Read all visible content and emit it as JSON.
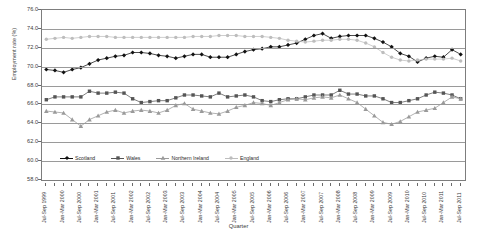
{
  "chart_data": {
    "type": "line",
    "title": "",
    "xlabel": "Quarter",
    "ylabel": "Employment rate (%)",
    "ylim": [
      58.0,
      76.0
    ],
    "ytick_labels": [
      "58.0",
      "60.0",
      "62.0",
      "64.0",
      "66.0",
      "68.0",
      "70.0",
      "72.0",
      "74.0",
      "76.0"
    ],
    "yticks": [
      58.0,
      60.0,
      62.0,
      64.0,
      66.0,
      68.0,
      70.0,
      72.0,
      74.0,
      76.0
    ],
    "grid": true,
    "legend_position": "inside-bottom",
    "categories": [
      "Jul-Sep 1999",
      "Oct-Dec 1999",
      "Jan-Mar 2000",
      "Apr-Jun 2000",
      "Jul-Sep 2000",
      "Oct-Dec 2000",
      "Jan-Mar 2001",
      "Apr-Jun 2001",
      "Jul-Sep 2001",
      "Oct-Dec 2001",
      "Jan-Mar 2002",
      "Apr-Jun 2002",
      "Jul-Sep 2002",
      "Oct-Dec 2002",
      "Jan-Mar 2003",
      "Apr-Jun 2003",
      "Jul-Sep 2003",
      "Oct-Dec 2003",
      "Jan-Mar 2004",
      "Apr-Jun 2004",
      "Jul-Sep 2004",
      "Oct-Dec 2004",
      "Jan-Mar 2005",
      "Apr-Jun 2005",
      "Jul-Sep 2005",
      "Oct-Dec 2005",
      "Jan-Mar 2006",
      "Apr-Jun 2006",
      "Jul-Sep 2006",
      "Oct-Dec 2006",
      "Jan-Mar 2007",
      "Apr-Jun 2007",
      "Jul-Sep 2007",
      "Oct-Dec 2007",
      "Jan-Mar 2008",
      "Apr-Jun 2008",
      "Jul-Sep 2008",
      "Oct-Dec 2008",
      "Jan-Mar 2009",
      "Apr-Jun 2009",
      "Jul-Sep 2009",
      "Oct-Dec 2009",
      "Jan-Mar 2010",
      "Apr-Jun 2010",
      "Jul-Sep 2010",
      "Oct-Dec 2010",
      "Jan-Mar 2011",
      "Apr-Jun 2011",
      "Jul-Sep 2011"
    ],
    "xtick_labels": [
      "Jul-Sep 1999",
      "",
      "Jan-Mar 2000",
      "",
      "Jul-Sep 2000",
      "",
      "Jan-Mar 2001",
      "",
      "Jul-Sep 2001",
      "",
      "Jan-Mar 2002",
      "",
      "Jul-Sep 2002",
      "",
      "Jan-Mar 2003",
      "",
      "Jul-Sep 2003",
      "",
      "Jan-Mar 2004",
      "",
      "Jul-Sep 2004",
      "",
      "Jan-Mar 2005",
      "",
      "Jul-Sep 2005",
      "",
      "Jan-Mar 2006",
      "",
      "Jul-Sep 2006",
      "",
      "Jan-Mar 2007",
      "",
      "Jul-Sep 2007",
      "",
      "Jan-Mar 2008",
      "",
      "Jul-Sep 2008",
      "",
      "Jan-Mar 2009",
      "",
      "Jul-Sep 2009",
      "",
      "Jan-Mar 2010",
      "",
      "Jul-Sep 2010",
      "",
      "Jan-Mar 2011",
      "",
      "Jul-Sep 2011"
    ],
    "series": [
      {
        "name": "Scotland",
        "color": "#111111",
        "marker": "diamond",
        "values": [
          69.7,
          69.6,
          69.4,
          69.7,
          69.9,
          70.3,
          70.7,
          70.9,
          71.1,
          71.2,
          71.5,
          71.5,
          71.4,
          71.2,
          71.1,
          70.9,
          71.1,
          71.3,
          71.3,
          71.0,
          71.0,
          71.0,
          71.3,
          71.6,
          71.8,
          71.9,
          72.1,
          72.1,
          72.3,
          72.5,
          72.9,
          73.3,
          73.5,
          73.0,
          73.2,
          73.3,
          73.3,
          73.3,
          73.0,
          72.6,
          72.1,
          71.4,
          71.1,
          70.5,
          70.9,
          71.1,
          71.0,
          71.8,
          71.3
        ]
      },
      {
        "name": "Wales",
        "color": "#555555",
        "marker": "square",
        "values": [
          66.5,
          66.8,
          66.8,
          66.8,
          66.8,
          67.4,
          67.2,
          67.2,
          67.3,
          67.2,
          66.6,
          66.2,
          66.3,
          66.4,
          66.4,
          66.7,
          67.0,
          67.0,
          66.9,
          66.8,
          67.2,
          66.8,
          66.9,
          67.0,
          66.8,
          66.4,
          66.3,
          66.5,
          66.6,
          66.6,
          66.8,
          67.0,
          67.0,
          67.0,
          67.5,
          67.1,
          67.1,
          66.9,
          66.9,
          66.6,
          66.2,
          66.2,
          66.4,
          66.6,
          67.0,
          67.3,
          67.2,
          67.0,
          66.6
        ]
      },
      {
        "name": "Northern Ireland",
        "color": "#9a9a9a",
        "marker": "triangle",
        "values": [
          65.3,
          65.2,
          65.1,
          64.4,
          63.7,
          64.4,
          64.8,
          65.2,
          65.4,
          65.1,
          65.3,
          65.4,
          65.3,
          65.1,
          65.4,
          65.9,
          66.1,
          65.5,
          65.3,
          65.1,
          65.0,
          65.3,
          65.7,
          65.9,
          66.2,
          66.1,
          65.9,
          66.2,
          66.5,
          66.6,
          66.5,
          66.7,
          66.8,
          66.7,
          67.0,
          66.6,
          66.2,
          65.5,
          64.8,
          64.1,
          63.9,
          64.2,
          64.7,
          65.2,
          65.4,
          65.6,
          66.2,
          66.8,
          66.6
        ]
      },
      {
        "name": "England",
        "color": "#bdbdbd",
        "marker": "circle",
        "values": [
          72.9,
          73.0,
          73.1,
          73.0,
          73.1,
          73.2,
          73.2,
          73.2,
          73.1,
          73.1,
          73.1,
          73.1,
          73.1,
          73.1,
          73.1,
          73.1,
          73.1,
          73.2,
          73.2,
          73.2,
          73.3,
          73.3,
          73.3,
          73.2,
          73.2,
          73.2,
          73.1,
          73.0,
          72.8,
          72.7,
          72.6,
          72.7,
          72.8,
          72.8,
          72.9,
          72.9,
          72.8,
          72.5,
          72.1,
          71.5,
          71.0,
          70.7,
          70.6,
          70.7,
          70.8,
          70.8,
          70.8,
          70.9,
          70.6
        ]
      }
    ]
  }
}
